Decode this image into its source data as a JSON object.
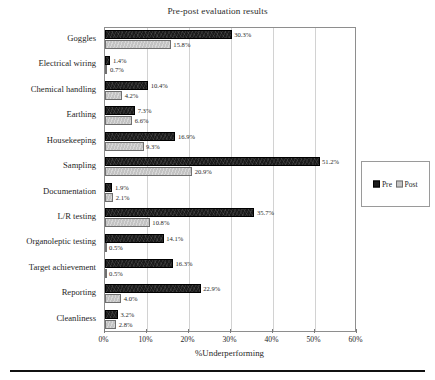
{
  "chart_data": {
    "type": "bar",
    "orientation": "horizontal",
    "title": "Pre-post evaluation results",
    "xlabel": "%Underperforming",
    "ylabel": "",
    "xlim": [
      0,
      60
    ],
    "xticks": [
      "0%",
      "10%",
      "20%",
      "30%",
      "40%",
      "50%",
      "60%"
    ],
    "xtick_values": [
      0,
      10,
      20,
      30,
      40,
      50,
      60
    ],
    "grid": true,
    "grid_axis": "x",
    "legend_position": "right",
    "categories": [
      "Goggles",
      "Electrical wiring",
      "Chemical handling",
      "Earthing",
      "Housekeeping",
      "Sampling",
      "Documentation",
      "L/R testing",
      "Organoleptic testing",
      "Target achievement",
      "Reporting",
      "Cleanliness"
    ],
    "series": [
      {
        "name": "Pre",
        "color": "#1b1b1b",
        "values": [
          30.3,
          1.4,
          10.4,
          7.3,
          16.9,
          51.2,
          1.9,
          35.7,
          14.1,
          16.3,
          22.9,
          3.2
        ],
        "labels": [
          "30.3%",
          "1.4%",
          "10.4%",
          "7.3%",
          "16.9%",
          "51.2%",
          "1.9%",
          "35.7%",
          "14.1%",
          "16.3%",
          "22.9%",
          "3.2%"
        ]
      },
      {
        "name": "Post",
        "color": "#c3c3c3",
        "values": [
          15.8,
          0.7,
          4.2,
          6.6,
          9.3,
          20.9,
          2.1,
          10.8,
          0.5,
          0.5,
          4.0,
          2.8
        ],
        "labels": [
          "15.8%",
          "0.7%",
          "4.2%",
          "6.6%",
          "9.3%",
          "20.9%",
          "2.1%",
          "10.8%",
          "0.5%",
          "0.5%",
          "4.0%",
          "2.8%"
        ]
      }
    ]
  },
  "legend": {
    "entries": [
      {
        "label": "Pre",
        "color": "#1b1b1b"
      },
      {
        "label": "Post",
        "color": "#c3c3c3"
      }
    ]
  }
}
